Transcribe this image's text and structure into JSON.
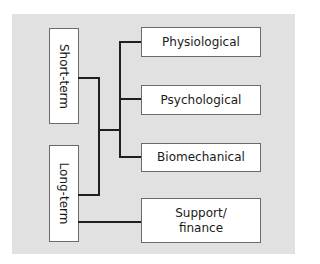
{
  "diagram": {
    "left_nodes": [
      {
        "id": "short-term",
        "label": "Short-term"
      },
      {
        "id": "long-term",
        "label": "Long-term"
      }
    ],
    "right_nodes": [
      {
        "id": "physiological",
        "label": "Physiological"
      },
      {
        "id": "psychological",
        "label": "Psychological"
      },
      {
        "id": "biomechanical",
        "label": "Biomechanical"
      },
      {
        "id": "support-finance",
        "label": "Support/ finance",
        "line1": "Support/",
        "line2": "finance"
      }
    ],
    "edges": [
      {
        "from": "short-term",
        "to": "physiological"
      },
      {
        "from": "short-term",
        "to": "psychological"
      },
      {
        "from": "short-term",
        "to": "biomechanical"
      },
      {
        "from": "long-term",
        "to": "physiological"
      },
      {
        "from": "long-term",
        "to": "psychological"
      },
      {
        "from": "long-term",
        "to": "biomechanical"
      },
      {
        "from": "long-term",
        "to": "support-finance"
      }
    ],
    "colors": {
      "background": "#e1e1e1",
      "box_fill": "#ffffff",
      "box_border": "#6a6a6a",
      "line": "#1f1f1f"
    }
  }
}
